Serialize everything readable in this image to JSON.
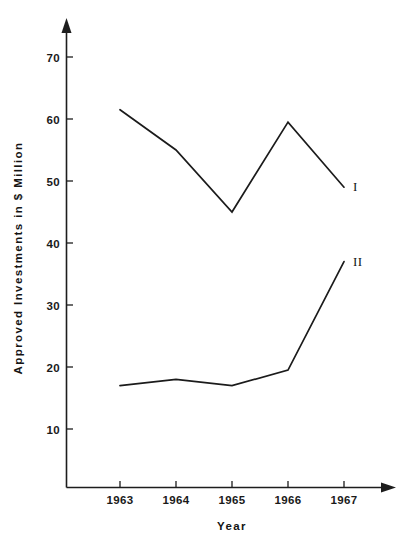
{
  "chart_data": {
    "type": "line",
    "title": "",
    "xlabel": "Year",
    "ylabel": "Approved Investments in $ Million",
    "categories": [
      "1963",
      "1964",
      "1965",
      "1966",
      "1967"
    ],
    "x": [
      1963,
      1964,
      1965,
      1966,
      1967
    ],
    "xlim": [
      1962.4,
      1967.6
    ],
    "ylim": [
      0,
      74
    ],
    "y_ticks": [
      10,
      20,
      30,
      40,
      50,
      60,
      70
    ],
    "y_tick_labels": [
      "10",
      "20",
      "30",
      "40",
      "50",
      "60",
      "70"
    ],
    "x_ticks": [
      1963,
      1964,
      1965,
      1966,
      1967
    ],
    "x_tick_labels": [
      "1963",
      "1964",
      "1965",
      "1966",
      "1967"
    ],
    "grid": false,
    "legend_position": "line-end-labels",
    "series": [
      {
        "name": "I",
        "label": "I",
        "color": "#1b1b1b",
        "values": [
          61.5,
          55,
          45,
          59.5,
          49
        ]
      },
      {
        "name": "II",
        "label": "II",
        "color": "#1b1b1b",
        "values": [
          17,
          18,
          17,
          19.5,
          37
        ]
      }
    ]
  },
  "axes": {
    "y_axis_name": "y-axis",
    "x_axis_name": "x-axis",
    "y_title": "Approved Investments in $ Million",
    "x_title": "Year"
  },
  "colors": {
    "ink": "#1b1b1b",
    "background": "#ffffff"
  }
}
